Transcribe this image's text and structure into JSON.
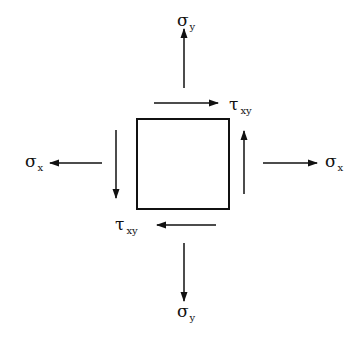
{
  "diagram": {
    "type": "stress-element",
    "element": {
      "shape": "square"
    },
    "labels": {
      "sigma_y_top": {
        "symbol": "σ",
        "subscript": "y"
      },
      "sigma_y_bottom": {
        "symbol": "σ",
        "subscript": "y"
      },
      "sigma_x_left": {
        "symbol": "σ",
        "subscript": "x"
      },
      "sigma_x_right": {
        "symbol": "σ",
        "subscript": "x"
      },
      "tau_xy_top": {
        "symbol": "τ",
        "subscript": "xy"
      },
      "tau_xy_bottom": {
        "symbol": "τ",
        "subscript": "xy"
      }
    },
    "arrows": [
      {
        "name": "normal-stress-y-up",
        "direction": "up"
      },
      {
        "name": "normal-stress-y-down",
        "direction": "down"
      },
      {
        "name": "normal-stress-x-left",
        "direction": "left"
      },
      {
        "name": "normal-stress-x-right",
        "direction": "right"
      },
      {
        "name": "shear-top",
        "direction": "right"
      },
      {
        "name": "shear-bottom",
        "direction": "left"
      },
      {
        "name": "shear-left",
        "direction": "down"
      },
      {
        "name": "shear-right",
        "direction": "up"
      }
    ],
    "colors": {
      "stroke": "#111111",
      "background": "#ffffff"
    }
  }
}
